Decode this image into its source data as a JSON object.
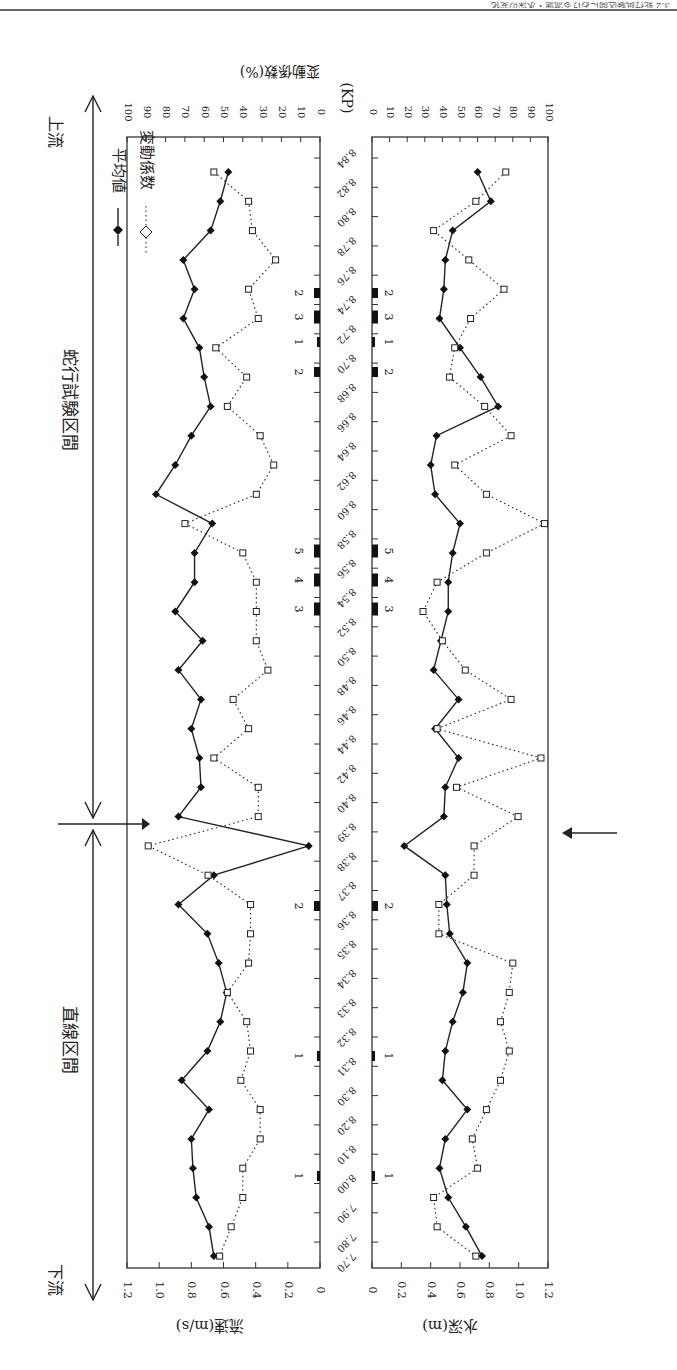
{
  "page_header": "3.2 蛇行試験区間における流速・水深の変化",
  "top_axis_title": "変動係数(%)",
  "kp_label": "(KP)",
  "legend": {
    "mean_label": "平均値",
    "cv_label": "変動係数"
  },
  "section_labels": {
    "upstream": "上流",
    "downstream": "下流",
    "meander_section": "蛇行試験区間",
    "straight_section": "直線区間"
  },
  "left_panel": {
    "ylabel": "流速(m/s)",
    "ticks": [
      "1.2",
      "1.0",
      "0.8",
      "0.6",
      "0.4",
      "0.2",
      "0"
    ]
  },
  "right_panel": {
    "ylabel": "水深(m)",
    "ticks": [
      "0",
      "0.2",
      "0.4",
      "0.6",
      "0.8",
      "1.0",
      "1.2"
    ]
  },
  "cv_ticks_left": [
    "100",
    "90",
    "80",
    "70",
    "60",
    "50",
    "40",
    "30",
    "20",
    "10",
    "0"
  ],
  "cv_ticks_right": [
    "0",
    "10",
    "20",
    "30",
    "40",
    "50",
    "60",
    "70",
    "80",
    "90",
    "100"
  ],
  "chart_data": [
    {
      "type": "line",
      "title": "流速 (Flow velocity) along KP",
      "xlabel": "(KP)",
      "ylabel": "流速(m/s)",
      "ylim": [
        0,
        1.2
      ],
      "y2label": "変動係数(%)",
      "y2lim": [
        0,
        100
      ],
      "categories": [
        "8.84",
        "8.82",
        "8.80",
        "8.78",
        "8.76",
        "8.74",
        "8.72",
        "8.70",
        "8.68",
        "8.66",
        "8.64",
        "8.62",
        "8.60",
        "8.58",
        "8.56",
        "8.54",
        "8.52",
        "8.50",
        "8.48",
        "8.46",
        "8.44",
        "8.42",
        "8.40",
        "8.39",
        "8.38",
        "8.37",
        "8.36",
        "8.35",
        "8.34",
        "8.33",
        "8.32",
        "8.31",
        "8.30",
        "8.20",
        "8.10",
        "8.00",
        "7.90",
        "7.80"
      ],
      "series": [
        {
          "name": "平均値",
          "axis": "left",
          "style": "solid-diamond",
          "values": [
            0.57,
            0.62,
            0.68,
            0.85,
            0.78,
            0.85,
            0.75,
            0.72,
            0.68,
            0.8,
            0.9,
            1.02,
            0.67,
            0.78,
            0.78,
            0.9,
            0.73,
            0.88,
            0.74,
            0.8,
            0.75,
            0.74,
            0.88,
            0.07,
            0.66,
            0.88,
            0.7,
            0.63,
            0.58,
            0.62,
            0.7,
            0.86,
            0.69,
            0.8,
            0.79,
            0.77,
            0.69,
            0.66
          ]
        },
        {
          "name": "変動係数",
          "axis": "right",
          "style": "dotted-square",
          "values": [
            55,
            37,
            35,
            23,
            37,
            32,
            54,
            38,
            48,
            31,
            24,
            33,
            70,
            40,
            33,
            33,
            33,
            27,
            45,
            37,
            55,
            32,
            32,
            89,
            58,
            36,
            36,
            37,
            48,
            38,
            36,
            41,
            31,
            31,
            40,
            40,
            46,
            52
          ]
        }
      ]
    },
    {
      "type": "line",
      "title": "水深 (Water depth) along KP",
      "xlabel": "(KP)",
      "ylabel": "水深(m)",
      "ylim": [
        0,
        1.2
      ],
      "y2label": "変動係数(%)",
      "y2lim": [
        0,
        100
      ],
      "categories": [
        "8.84",
        "8.82",
        "8.80",
        "8.78",
        "8.76",
        "8.74",
        "8.72",
        "8.70",
        "8.68",
        "8.66",
        "8.64",
        "8.62",
        "8.60",
        "8.58",
        "8.56",
        "8.54",
        "8.52",
        "8.50",
        "8.48",
        "8.46",
        "8.44",
        "8.42",
        "8.40",
        "8.39",
        "8.38",
        "8.37",
        "8.36",
        "8.35",
        "8.34",
        "8.33",
        "8.32",
        "8.31",
        "8.30",
        "8.20",
        "8.10",
        "8.00",
        "7.90",
        "7.80"
      ],
      "series": [
        {
          "name": "平均値",
          "axis": "left",
          "style": "solid-diamond",
          "values": [
            0.72,
            0.81,
            0.55,
            0.5,
            0.49,
            0.46,
            0.6,
            0.74,
            0.86,
            0.44,
            0.4,
            0.43,
            0.6,
            0.55,
            0.52,
            0.52,
            0.47,
            0.42,
            0.59,
            0.43,
            0.59,
            0.5,
            0.49,
            0.22,
            0.5,
            0.51,
            0.53,
            0.65,
            0.62,
            0.55,
            0.5,
            0.48,
            0.65,
            0.5,
            0.46,
            0.52,
            0.64,
            0.75
          ]
        },
        {
          "name": "変動係数",
          "axis": "right",
          "style": "dotted-square",
          "values": [
            76,
            59,
            35,
            55,
            75,
            56,
            47,
            44,
            64,
            79,
            47,
            65,
            98,
            65,
            37,
            29,
            40,
            53,
            79,
            37,
            96,
            48,
            83,
            58,
            58,
            38,
            38,
            80,
            78,
            73,
            78,
            73,
            65,
            57,
            60,
            35,
            37,
            59
          ]
        }
      ]
    }
  ],
  "drop_structures": {
    "labels": [
      "2",
      "3",
      "1",
      "2",
      "5",
      "4",
      "3",
      "2",
      "1",
      "1"
    ],
    "kp_positions": [
      "8.73",
      "8.715",
      "8.695",
      "8.67",
      "8.55",
      "8.53",
      "8.51",
      "8.41",
      "8.30",
      "8.15"
    ]
  },
  "boundary_arrow_kp": "8.395"
}
